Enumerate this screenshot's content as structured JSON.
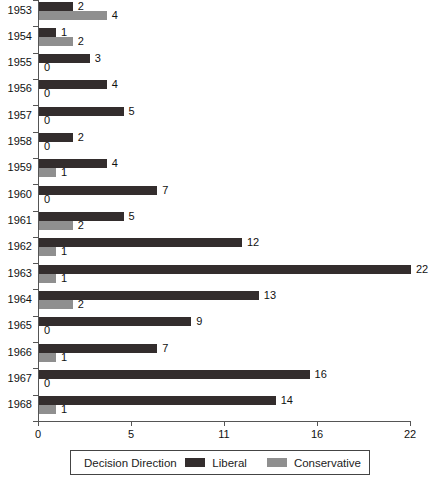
{
  "chart_data": {
    "type": "bar",
    "orientation": "horizontal",
    "title": "",
    "categories": [
      "1953",
      "1954",
      "1955",
      "1956",
      "1957",
      "1958",
      "1959",
      "1960",
      "1961",
      "1962",
      "1963",
      "1964",
      "1965",
      "1966",
      "1967",
      "1968"
    ],
    "series": [
      {
        "name": "Liberal",
        "color": "#332d2d",
        "values": [
          2,
          1,
          3,
          4,
          5,
          2,
          4,
          7,
          5,
          12,
          22,
          13,
          9,
          7,
          16,
          14
        ]
      },
      {
        "name": "Conservative",
        "color": "#8f8f8f",
        "values": [
          4,
          2,
          0,
          0,
          0,
          0,
          1,
          0,
          2,
          1,
          1,
          2,
          0,
          1,
          0,
          1
        ]
      }
    ],
    "xlim": [
      0,
      22
    ],
    "x_tick_labels": [
      "0",
      "5",
      "11",
      "16",
      "22"
    ],
    "value_labels": true,
    "grid": false,
    "legend": {
      "title": "Decision Direction",
      "position": "bottom"
    }
  },
  "colors": {
    "axis": "#555555",
    "text": "#111111",
    "background": "#ffffff"
  }
}
